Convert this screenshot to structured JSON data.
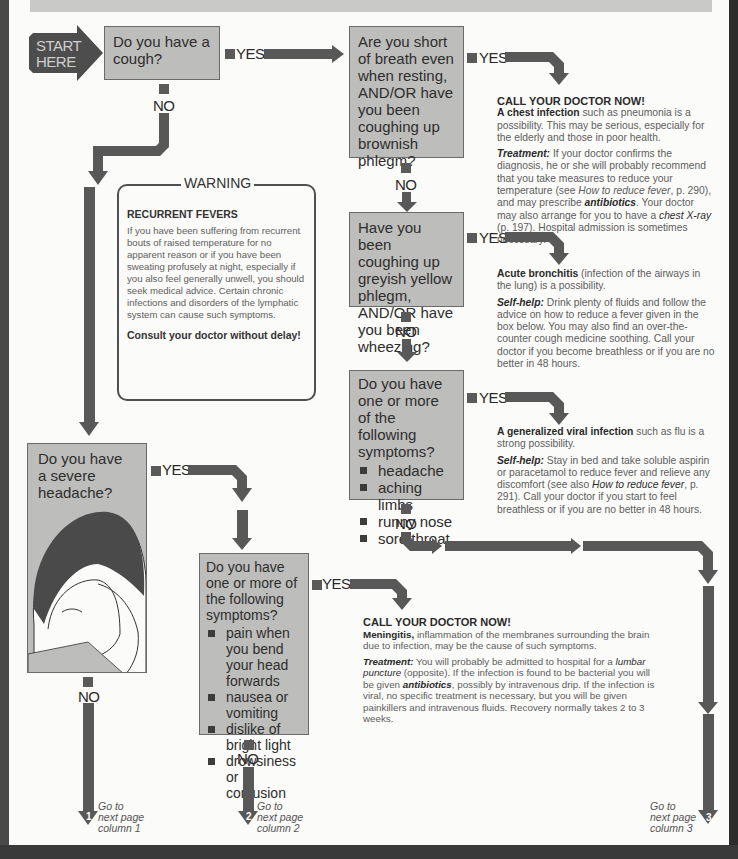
{
  "start": {
    "label_line1": "START",
    "label_line2": "HERE"
  },
  "connectors": {
    "yes": "YES",
    "no": "NO"
  },
  "questions": {
    "q1": {
      "text": "Do you have a cough?"
    },
    "q2": {
      "text": "Are you short of breath even when resting, AND/OR have you been coughing up brownish phlegm?"
    },
    "q3": {
      "text": "Have you been coughing up greyish yellow phlegm, AND/OR have you been wheezing?"
    },
    "q4": {
      "text": "Do you have one or more of the following symptoms?",
      "items": [
        "headache",
        "aching limbs",
        "runny nose",
        "sore throat"
      ]
    },
    "q5": {
      "text": "Do you have a severe headache?"
    },
    "q6": {
      "text": "Do you have one or more of the following symptoms?",
      "items": [
        "pain when you bend your head forwards",
        "nausea or vomiting",
        "dislike of bright light",
        "drowsiness or confusion"
      ]
    }
  },
  "answers": {
    "a2": {
      "heading": "CALL YOUR DOCTOR NOW!",
      "p1_bold": "A chest infection",
      "p1_rest": " such as pneumonia is a possibility. This may be serious, especially for the elderly and those in poor health.",
      "p2_label": "Treatment:",
      "p2_a": " If your doctor confirms the diagnosis, he or she will probably recommend that you take measures to reduce your temperature (see ",
      "p2_ref1": "How to reduce fever",
      "p2_b": ", p. 290), and may prescribe ",
      "p2_ref2": "antibiotics",
      "p2_c": ". Your doctor may also arrange for you to have a ",
      "p2_ref3": "chest X-ray",
      "p2_d": " (p. 197). Hospital admission is sometimes necessary."
    },
    "a3": {
      "p1_bold": "Acute bronchitis",
      "p1_rest": " (infection of the airways in the lung) is a possibility.",
      "p2_label": "Self-help:",
      "p2_text": " Drink plenty of fluids and follow the advice on how to reduce a fever given in the box below. You may also find an over-the-counter cough medicine soothing. Call your doctor if you become breathless or if you are no better in 48 hours."
    },
    "a4": {
      "p1_bold": "A generalized viral infection",
      "p1_rest": " such as flu is a strong possibility.",
      "p2_label": "Self-help:",
      "p2_a": " Stay in bed and take soluble aspirin or paracetamol to reduce fever and relieve any discomfort (see also ",
      "p2_ref": "How to reduce fever",
      "p2_b": ", p. 291). Call your doctor if you start to feel breathless or if you are no better in 48 hours."
    },
    "a6": {
      "heading": "CALL YOUR DOCTOR NOW!",
      "p1_bold": "Meningitis,",
      "p1_rest": " inflammation of the membranes surrounding the brain due to infection, may be the cause of such symptoms.",
      "p2_label": "Treatment:",
      "p2_a": " You will probably be admitted to hospital for a ",
      "p2_ref1": "lumbar puncture",
      "p2_b": " (opposite). If the infection is found to be bacterial you will be given ",
      "p2_ref2": "antibiotics",
      "p2_c": ", possibly by intravenous drip. If the infection is viral, no specific treatment is necessary, but you will be given painkillers and intravenous fluids. Recovery normally takes 2 to 3 weeks."
    }
  },
  "warning": {
    "title": "WARNING",
    "heading": "RECURRENT FEVERS",
    "body": "If you have been suffering from recurrent bouts of raised temperature for no apparent reason or if you have been sweating profusely at night, especially if you also feel generally unwell, you should seek medical advice. Certain chronic infections and disorders of the lymphatic system can cause such symptoms.",
    "cta": "Consult your doctor without delay!"
  },
  "goto": [
    {
      "num": "1",
      "line1": "Go to",
      "line2": "next page",
      "line3": "column 1"
    },
    {
      "num": "2",
      "line1": "Go to",
      "line2": "next page",
      "line3": "column 2"
    },
    {
      "num": "3",
      "line1": "Go to",
      "line2": "next page",
      "line3": "column 3"
    }
  ],
  "colors": {
    "arrow": "#585858",
    "box_fill": "#bdbdbb",
    "start_fill": "#4d4d4d",
    "page": "#fbfbf9"
  }
}
